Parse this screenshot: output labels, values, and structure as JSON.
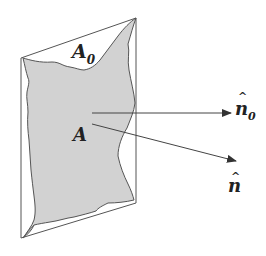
{
  "diagram": {
    "title": "",
    "labels": {
      "projected_area": "A",
      "projected_area_sub": "0",
      "surface_area": "A",
      "normal_0": "n",
      "normal_0_hat": "^",
      "normal_0_sub": "0",
      "normal": "n",
      "normal_hat": "^"
    },
    "colors": {
      "stroke": "#555555",
      "fill": "#d2d2d2",
      "text": "#222222",
      "background": "#ffffff"
    }
  }
}
